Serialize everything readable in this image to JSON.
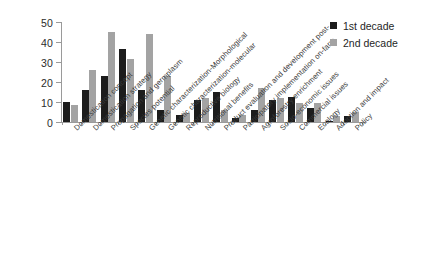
{
  "chart_data": {
    "type": "bar",
    "title": "",
    "xlabel": "",
    "ylabel": "",
    "ylim": [
      0,
      50
    ],
    "yticks": [
      0,
      10,
      20,
      30,
      40,
      50
    ],
    "grid": false,
    "legend_position": "top-right",
    "categories": [
      "Domestication concept",
      "Domestication strategy",
      "Propagation and germplasm",
      "Species potential",
      "Genetic characterization-Morphological",
      "Genetic characterization-molecular",
      "Reproductive biology",
      "Nutritional benefits",
      "Product evaluation and development post-",
      "Participatory implementation on-farm",
      "Agroforestry enrichment",
      "Socio-economic issues",
      "Commercial issues",
      "Ecology",
      "Adoption and impact",
      "Policy"
    ],
    "series": [
      {
        "name": "1st decade",
        "color": "#1c1c1c",
        "values": [
          10,
          16,
          23,
          36.5,
          16,
          6,
          3.5,
          11,
          15,
          2,
          6,
          11,
          12.5,
          7,
          0.7,
          3
        ]
      },
      {
        "name": "2nd decade",
        "color": "#a3a3a3",
        "values": [
          8.5,
          26,
          45,
          31.5,
          44,
          23,
          4.5,
          12,
          6,
          3.5,
          17,
          12,
          9.5,
          9.5,
          3,
          5
        ]
      }
    ]
  },
  "legend": {
    "items": [
      {
        "label": "1st decade",
        "color": "#1c1c1c"
      },
      {
        "label": "2nd decade",
        "color": "#a3a3a3"
      }
    ]
  }
}
